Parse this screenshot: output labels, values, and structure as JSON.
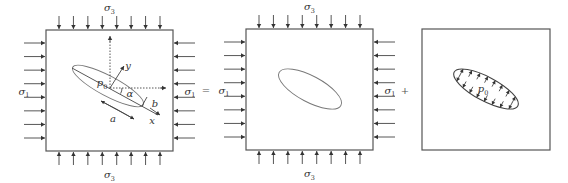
{
  "figure": {
    "operators": [
      "=",
      "+"
    ],
    "panels": [
      {
        "id": "total",
        "labels": {
          "top_stress": {
            "symbol": "σ",
            "sub": "3"
          },
          "bottom_stress": {
            "symbol": "σ",
            "sub": "3"
          },
          "left_stress": {
            "symbol": "σ",
            "sub": "1"
          },
          "right_stress": {
            "symbol": "σ",
            "sub": "1"
          },
          "pressure": {
            "symbol": "p",
            "sub": "0"
          },
          "half_length": "a",
          "half_width": "b",
          "angle": "α",
          "axis_x": "x",
          "axis_y": "y"
        },
        "arrows_per_side": 8,
        "crack_shown": true,
        "local_axes_shown": true
      },
      {
        "id": "far-field",
        "labels": {
          "top_stress": {
            "symbol": "σ",
            "sub": "3"
          },
          "bottom_stress": {
            "symbol": "σ",
            "sub": "3"
          },
          "left_stress": {
            "symbol": "σ",
            "sub": "1"
          },
          "right_stress": {
            "symbol": "σ",
            "sub": "1"
          }
        },
        "arrows_per_side": 8,
        "crack_shown": true
      },
      {
        "id": "internal-pressure",
        "labels": {
          "pressure": {
            "symbol": "p",
            "sub": "0"
          }
        },
        "pressure_arrows_per_face": 8,
        "crack_shown": true
      }
    ]
  }
}
